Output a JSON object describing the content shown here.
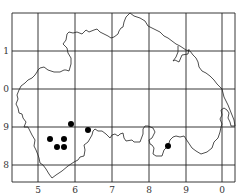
{
  "map": {
    "grid": {
      "vertical_lines_x": [
        12,
        38,
        75,
        112,
        149,
        186,
        222,
        235
      ],
      "horizontal_lines_y": [
        13,
        51,
        89,
        127,
        165,
        182
      ],
      "color": "#222222"
    },
    "x_axis_labels": [
      {
        "text": "5",
        "x": 38
      },
      {
        "text": "6",
        "x": 75
      },
      {
        "text": "7",
        "x": 112
      },
      {
        "text": "8",
        "x": 149
      },
      {
        "text": "9",
        "x": 186
      },
      {
        "text": "0",
        "x": 222
      }
    ],
    "y_axis_labels": [
      {
        "text": "1",
        "y": 51
      },
      {
        "text": "0",
        "y": 89
      },
      {
        "text": "9",
        "y": 127
      },
      {
        "text": "8",
        "y": 165
      }
    ],
    "points": [
      {
        "x": 71,
        "y": 124
      },
      {
        "x": 88,
        "y": 130
      },
      {
        "x": 50,
        "y": 139
      },
      {
        "x": 64,
        "y": 139
      },
      {
        "x": 57,
        "y": 147
      },
      {
        "x": 64,
        "y": 147
      },
      {
        "x": 168,
        "y": 146
      }
    ],
    "point_color": "#000000"
  }
}
